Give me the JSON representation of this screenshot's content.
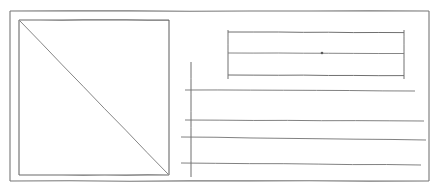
{
  "document": {
    "title": "Hand-drawn wireframe sketch",
    "kind": "pencil-on-paper layout sketch",
    "background_color": "#ffffff",
    "ink_color": "#6b6b6b",
    "ink_color_dark": "#555555",
    "ink_color_light": "#8a8a8a",
    "canvas": {
      "width": 436,
      "height": 193
    },
    "visible_text": ""
  },
  "shapes": {
    "page_frame": {
      "name": "outer page border",
      "x": 10,
      "y": 11,
      "width": 419,
      "height": 170,
      "stroke_width": 1.1,
      "color": "#777777"
    },
    "image_placeholder": {
      "name": "square with diagonal (image placeholder)",
      "x": 19,
      "y": 20,
      "width": 150,
      "height": 155,
      "stroke_width": 1.1,
      "color": "#6b6b6b",
      "diagonal": {
        "x1": 20,
        "y1": 21,
        "x2": 168,
        "y2": 174,
        "stroke_width": 0.9,
        "color": "#777777"
      }
    },
    "headline_block": {
      "name": "upper-right bracketed text block",
      "x": 228,
      "y": 32,
      "width": 176,
      "height": 44,
      "stroke_width": 1.0,
      "color": "#707070",
      "left_rule": {
        "x": 228,
        "y1": 30,
        "y2": 79
      },
      "right_rule": {
        "x": 404,
        "y1": 30,
        "y2": 79
      },
      "top_rule": {
        "y": 32,
        "x1": 228,
        "x2": 404
      },
      "middle_rule": {
        "y": 53,
        "x1": 228,
        "x2": 404
      },
      "bottom_rule": {
        "y": 75,
        "x1": 228,
        "x2": 404
      },
      "center_dot": {
        "x": 322,
        "y": 53,
        "r": 1.3
      }
    },
    "body_axis": {
      "name": "vertical guide line",
      "x": 191,
      "y1": 62,
      "y2": 177,
      "stroke_width": 1.0,
      "color": "#6f6f6f"
    },
    "body_rules": [
      {
        "name": "body-rule-1",
        "y": 90,
        "x1": 185,
        "x2": 415,
        "slope": 1,
        "stroke_width": 0.9
      },
      {
        "name": "body-rule-2",
        "y": 120,
        "x1": 185,
        "x2": 424,
        "slope": 1,
        "stroke_width": 0.9
      },
      {
        "name": "body-rule-3",
        "y": 137,
        "x1": 181,
        "x2": 426,
        "slope": 3,
        "stroke_width": 0.9
      },
      {
        "name": "body-rule-4",
        "y": 163,
        "x1": 181,
        "x2": 421,
        "slope": 2,
        "stroke_width": 0.9
      }
    ]
  },
  "legend": {
    "image_placeholder_label": "image placeholder",
    "headline_block_label": "headline / title block",
    "body_rules_label": "body copy lines",
    "page_frame_label": "page boundary"
  }
}
